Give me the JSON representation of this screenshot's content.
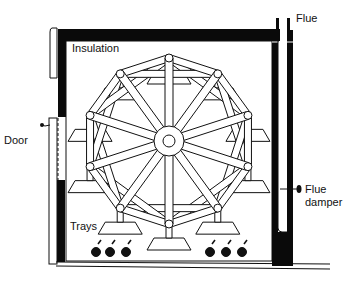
{
  "diagram": {
    "type": "cross-section of oven with rotating reel (Ferris-wheel) tray system",
    "labels": {
      "insulation": "Insulation",
      "flue": "Flue",
      "door": "Door",
      "flue_damper_line1": "Flue",
      "flue_damper_line2": "damper",
      "trays": "Trays"
    },
    "wheel": {
      "center": [
        169,
        141
      ],
      "pivot_count": 10,
      "pivot_radius": 83
    },
    "burners": {
      "left_group_count": 3,
      "right_group_count": 3
    },
    "colors": {
      "line": "#111111",
      "fill": "#ffffff",
      "insulation": "#0a0a0a"
    }
  }
}
